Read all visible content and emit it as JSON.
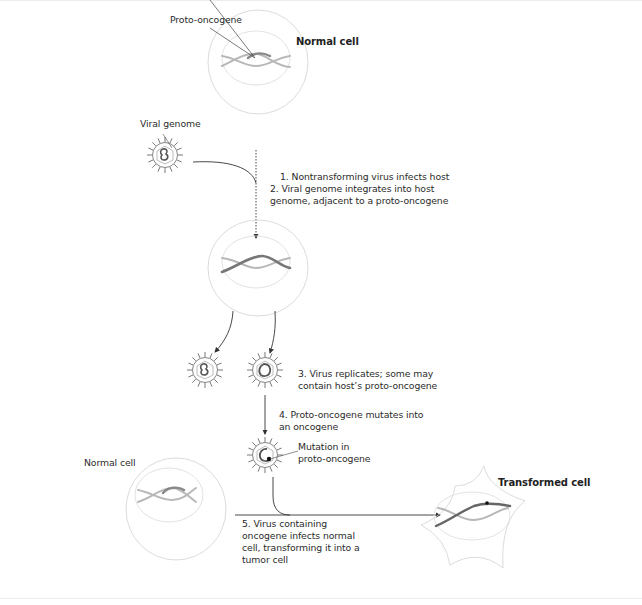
{
  "figure": {
    "labels": {
      "proto_oncogene": "Proto-oncogene",
      "normal_cell_top": "Normal cell",
      "viral_genome": "Viral genome",
      "mutation": "Mutation in\nproto-oncogene",
      "normal_cell_bottom": "Normal cell",
      "transformed_cell": "Transformed cell"
    },
    "steps": [
      {
        "id": 1,
        "text": "1. Nontransforming virus infects host"
      },
      {
        "id": 2,
        "text": "2. Viral genome integrates into host\ngenome, adjacent to a proto-oncogene"
      },
      {
        "id": 3,
        "text": "3. Virus replicates; some may\ncontain host’s proto-oncogene"
      },
      {
        "id": 4,
        "text": "4. Proto-oncogene mutates into\nan oncogene"
      },
      {
        "id": 5,
        "text": "5. Virus containing\noncogene infects normal\ncell, transforming it into a\ntumor cell"
      }
    ],
    "colors": {
      "cell_outline": "#cfcfcf",
      "dna_light": "#b5b5b5",
      "dna_dark": "#707070",
      "arrow": "#333333",
      "text": "#2b2b2b"
    }
  }
}
